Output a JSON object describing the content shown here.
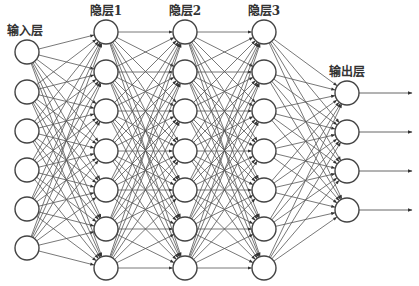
{
  "diagram": {
    "type": "feedforward-neural-network",
    "colors": {
      "node_stroke": "#444444",
      "edge": "#555555",
      "text": "#333333",
      "background": "#ffffff"
    },
    "node_radius": 12,
    "layers": [
      {
        "id": "input",
        "label": "输入层",
        "x": 27,
        "label_y": 35,
        "nodes_y": [
          52,
          92,
          131,
          170,
          209,
          248
        ]
      },
      {
        "id": "hidden1",
        "label": "隐层1",
        "x": 106,
        "label_y": 15,
        "nodes_y": [
          32,
          72,
          111,
          151,
          190,
          229,
          268
        ]
      },
      {
        "id": "hidden2",
        "label": "隐层2",
        "x": 185,
        "label_y": 15,
        "nodes_y": [
          32,
          72,
          111,
          151,
          190,
          229,
          268
        ]
      },
      {
        "id": "hidden3",
        "label": "隐层3",
        "x": 264,
        "label_y": 15,
        "nodes_y": [
          32,
          72,
          111,
          151,
          190,
          229,
          268
        ]
      },
      {
        "id": "output",
        "label": "输出层",
        "x": 347,
        "label_y": 76,
        "nodes_y": [
          93,
          132,
          171,
          210
        ]
      }
    ],
    "output_arrow_end_x": 412
  }
}
